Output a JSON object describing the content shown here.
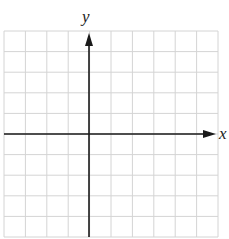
{
  "diagram": {
    "type": "coordinate-grid",
    "x_axis_label": "x",
    "y_axis_label": "y",
    "grid": {
      "columns": 10,
      "rows": 10,
      "origin_column": 4,
      "origin_row": 5,
      "line_color": "#d4d4d4",
      "axis_color": "#1a1a1a"
    }
  }
}
